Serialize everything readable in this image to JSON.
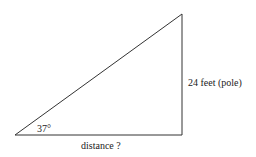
{
  "diagram": {
    "type": "right-triangle",
    "vertices": {
      "bottom_left": [
        15,
        135
      ],
      "bottom_right": [
        182,
        135
      ],
      "top": [
        182,
        14
      ]
    },
    "labels": {
      "angle": "37°",
      "vertical_side": "24 feet (pole)",
      "horizontal_side": "distance ?"
    },
    "colors": {
      "line": "#333333",
      "text": "#222222",
      "background": "#ffffff"
    }
  }
}
